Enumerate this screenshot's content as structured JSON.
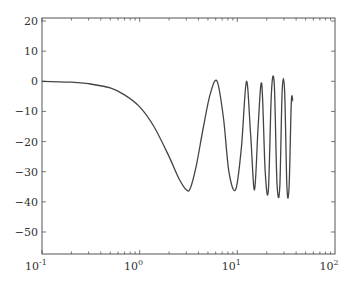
{
  "chart_data": {
    "type": "line",
    "title": "",
    "xlabel": "",
    "ylabel": "",
    "xscale": "log",
    "xlim": [
      0.1,
      100
    ],
    "ylim": [
      -57.3,
      21
    ],
    "grid": false,
    "legend": null,
    "x_ticks": [
      {
        "value": 0.1,
        "base": "10",
        "exp": "-1"
      },
      {
        "value": 1,
        "base": "10",
        "exp": "0"
      },
      {
        "value": 10,
        "base": "10",
        "exp": "1"
      },
      {
        "value": 100,
        "base": "10",
        "exp": "2"
      }
    ],
    "y_ticks": [
      20,
      10,
      0,
      -10,
      -20,
      -30,
      -40,
      -50
    ],
    "y_tick_labels": [
      "20",
      "10",
      "0",
      "−10",
      "−20",
      "−30",
      "−40",
      "−50"
    ],
    "series": [
      {
        "name": "response",
        "color": "#444444",
        "x": [
          0.1,
          0.2,
          0.3,
          0.5,
          0.7,
          1.0,
          1.4,
          2.0,
          2.5,
          3.0,
          3.3,
          3.8,
          4.5,
          5.3,
          6.2,
          7.2,
          8.2,
          9.6,
          11.0,
          12.4,
          13.7,
          15.0,
          16.4,
          17.8,
          19.3,
          20.8,
          22.3,
          23.9,
          25.5,
          27.2,
          28.8,
          30.5,
          32.2,
          33.9,
          35.7,
          37.0
        ],
        "y": [
          0,
          -0.3,
          -0.8,
          -2.2,
          -4.5,
          -8.5,
          -15,
          -25,
          -32,
          -36,
          -35.5,
          -28,
          -15,
          -4,
          0,
          -12,
          -30,
          -36,
          -22,
          0,
          -18,
          -36,
          -14,
          -1,
          -30,
          -36,
          -4,
          -1,
          -34,
          -35,
          -3,
          -3,
          -35,
          -35,
          -7,
          -6.5
        ]
      }
    ]
  }
}
